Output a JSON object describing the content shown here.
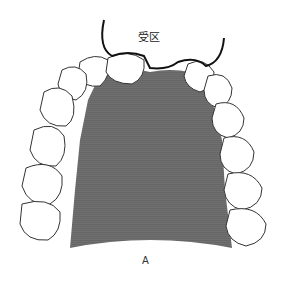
{
  "figure": {
    "label_top": "受区",
    "label_bottom": "A",
    "colors": {
      "palate_fill": "#6e6e6e",
      "tooth_fill": "#ffffff",
      "outline": "#222222",
      "recipient_line": "#111111"
    }
  }
}
